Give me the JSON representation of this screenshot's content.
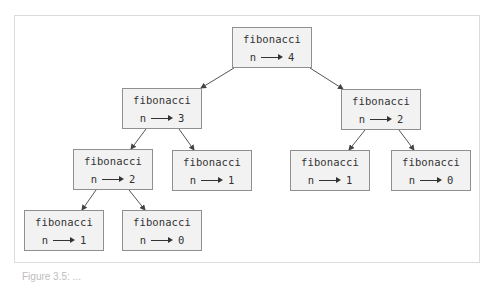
{
  "diagram": {
    "type": "call-tree",
    "nodes": [
      {
        "id": "root",
        "function": "fibonacci",
        "param": "n",
        "value": "4"
      },
      {
        "id": "l1a",
        "function": "fibonacci",
        "param": "n",
        "value": "3"
      },
      {
        "id": "l1b",
        "function": "fibonacci",
        "param": "n",
        "value": "2"
      },
      {
        "id": "l2a",
        "function": "fibonacci",
        "param": "n",
        "value": "2"
      },
      {
        "id": "l2b",
        "function": "fibonacci",
        "param": "n",
        "value": "1"
      },
      {
        "id": "l2c",
        "function": "fibonacci",
        "param": "n",
        "value": "1"
      },
      {
        "id": "l2d",
        "function": "fibonacci",
        "param": "n",
        "value": "0"
      },
      {
        "id": "l3a",
        "function": "fibonacci",
        "param": "n",
        "value": "1"
      },
      {
        "id": "l3b",
        "function": "fibonacci",
        "param": "n",
        "value": "0"
      }
    ],
    "edges": [
      [
        "root",
        "l1a"
      ],
      [
        "root",
        "l1b"
      ],
      [
        "l1a",
        "l2a"
      ],
      [
        "l1a",
        "l2b"
      ],
      [
        "l1b",
        "l2c"
      ],
      [
        "l1b",
        "l2d"
      ],
      [
        "l2a",
        "l3a"
      ],
      [
        "l2a",
        "l3b"
      ]
    ]
  },
  "caption": "Figure 3.5: ..."
}
